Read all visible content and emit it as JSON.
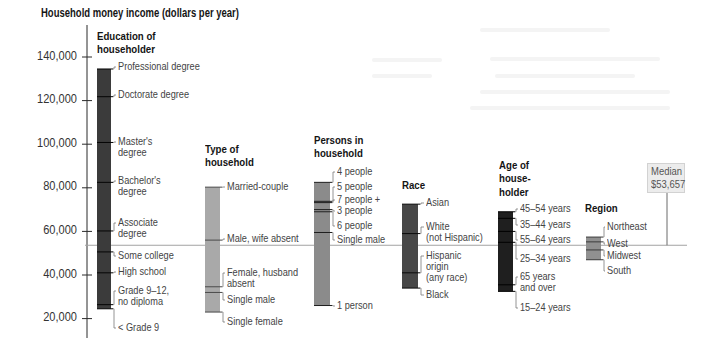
{
  "chart_data": {
    "type": "bar",
    "subtype": "floating-range-strips",
    "title": "Household money income (dollars per year)",
    "xlabel": "",
    "ylabel": "Household money income (dollars per year)",
    "ylim": [
      10000,
      150000
    ],
    "grid": false,
    "legend": "none (categories labeled directly beside each strip)",
    "y_ticks": [
      {
        "value": 140000,
        "label": "140,000"
      },
      {
        "value": 120000,
        "label": "120,000"
      },
      {
        "value": 100000,
        "label": "100,000"
      },
      {
        "value": 80000,
        "label": "80,000"
      },
      {
        "value": 60000,
        "label": "60,000"
      },
      {
        "value": 40000,
        "label": "40,000"
      },
      {
        "value": 20000,
        "label": "20,000"
      }
    ],
    "median": {
      "value": 53657,
      "label": "Median",
      "value_label": "$53,657"
    },
    "layout": {
      "y_ref_value": 140000,
      "y_ref_px": 57,
      "px_per_unit": 0.00218,
      "axis_x_px": 87,
      "axis_top_px": 25,
      "median_line_end_px": 687,
      "median_leader_x_px": 667
    },
    "groups": [
      {
        "name": "Education of householder",
        "heading_lines": [
          "Education of",
          "householder"
        ],
        "heading_x_px": 97,
        "heading_y_px": [
          37,
          50
        ],
        "color": "#3b3b3b",
        "tick_color": "#050505",
        "x_px": 97,
        "width_px": 14,
        "label_x_px": 118,
        "categories": [
          {
            "label": "Professional degree",
            "lines": [
              "Professional degree"
            ],
            "value": 134500,
            "label_y_px": 67
          },
          {
            "label": "Doctorate degree",
            "lines": [
              "Doctorate degree"
            ],
            "value": 121800,
            "label_y_px": 95
          },
          {
            "label": "Master's degree",
            "lines": [
              "Master's",
              "degree"
            ],
            "value": 100800,
            "label_y_px": 142
          },
          {
            "label": "Bachelor's degree",
            "lines": [
              "Bachelor's",
              "degree"
            ],
            "value": 82500,
            "label_y_px": 181
          },
          {
            "label": "Associate degree",
            "lines": [
              "Associate",
              "degree"
            ],
            "value": 60200,
            "label_y_px": 223
          },
          {
            "label": "Some college",
            "lines": [
              "Some college"
            ],
            "value": 50600,
            "label_y_px": 256
          },
          {
            "label": "High school",
            "lines": [
              "High school"
            ],
            "value": 41000,
            "label_y_px": 272
          },
          {
            "label": "Grade 9–12, no diploma",
            "lines": [
              "Grade 9–12,",
              "no diploma"
            ],
            "value": 26400,
            "label_y_px": 291
          },
          {
            "label": "< Grade 9",
            "lines": [
              "< Grade 9"
            ],
            "value": 24500,
            "label_y_px": 328
          }
        ]
      },
      {
        "name": "Type of household",
        "heading_lines": [
          "Type of",
          "household"
        ],
        "heading_x_px": 205,
        "heading_y_px": [
          150,
          163
        ],
        "color": "#a9a9a9",
        "tick_color": "#4a4a4a",
        "x_px": 205,
        "width_px": 15,
        "label_x_px": 227,
        "categories": [
          {
            "label": "Married-couple",
            "lines": [
              "Married-couple"
            ],
            "value": 80300,
            "label_y_px": 187
          },
          {
            "label": "Male, wife absent",
            "lines": [
              "Male, wife absent"
            ],
            "value": 56000,
            "label_y_px": 239
          },
          {
            "label": "Female, husband absent",
            "lines": [
              "Female, husband",
              "absent"
            ],
            "value": 34600,
            "label_y_px": 273
          },
          {
            "label": "Single male",
            "lines": [
              "Single male"
            ],
            "value": 32000,
            "label_y_px": 300
          },
          {
            "label": "Single female",
            "lines": [
              "Single female"
            ],
            "value": 23000,
            "label_y_px": 322
          }
        ]
      },
      {
        "name": "Persons in household",
        "heading_lines": [
          "Persons in",
          "household"
        ],
        "heading_x_px": 314,
        "heading_y_px": [
          141,
          154
        ],
        "color": "#8b8b8b",
        "tick_color": "#1e1e1e",
        "x_px": 314,
        "width_px": 16,
        "label_x_px": 337,
        "categories": [
          {
            "label": "4 people",
            "lines": [
              "4 people"
            ],
            "value": 82500,
            "label_y_px": 172
          },
          {
            "label": "5 people",
            "lines": [
              "5 people"
            ],
            "value": 73800,
            "label_y_px": 187
          },
          {
            "label": "7 people +",
            "lines": [
              "7 people +"
            ],
            "value": 73200,
            "label_y_px": 200
          },
          {
            "label": "3 people",
            "lines": [
              "3 people"
            ],
            "value": 70000,
            "label_y_px": 211
          },
          {
            "label": "6 people",
            "lines": [
              "6 people"
            ],
            "value": 69000,
            "label_y_px": 226
          },
          {
            "label": "Single male",
            "lines": [
              "Single male"
            ],
            "value": 59500,
            "label_y_px": 240
          },
          {
            "label": "1 person",
            "lines": [
              "1 person"
            ],
            "value": 26000,
            "label_y_px": 306
          }
        ]
      },
      {
        "name": "Race",
        "heading_lines": [
          "Race"
        ],
        "heading_x_px": 402,
        "heading_y_px": [
          186
        ],
        "color": "#474747",
        "tick_color": "#0a0a0a",
        "x_px": 402,
        "width_px": 16,
        "label_x_px": 426,
        "categories": [
          {
            "label": "Asian",
            "lines": [
              "Asian"
            ],
            "value": 72500,
            "label_y_px": 203
          },
          {
            "label": "White (not Hispanic)",
            "lines": [
              "White",
              "(not Hispanic)"
            ],
            "value": 59000,
            "label_y_px": 227
          },
          {
            "label": "Hispanic origin (any race)",
            "lines": [
              "Hispanic",
              "origin",
              "(any race)"
            ],
            "value": 41000,
            "label_y_px": 256
          },
          {
            "label": "Black",
            "lines": [
              "Black"
            ],
            "value": 34000,
            "label_y_px": 295
          }
        ]
      },
      {
        "name": "Age of householder",
        "heading_lines": [
          "Age of",
          "house-",
          "holder"
        ],
        "heading_x_px": 499,
        "heading_y_px": [
          166,
          179,
          193
        ],
        "color": "#1f1f1f",
        "tick_color": "#000000",
        "x_px": 498,
        "width_px": 15,
        "label_x_px": 520,
        "categories": [
          {
            "label": "45–54 years",
            "lines": [
              "45–54 years"
            ],
            "value": 69000,
            "label_y_px": 209
          },
          {
            "label": "35–44 years",
            "lines": [
              "35–44 years"
            ],
            "value": 66000,
            "label_y_px": 225
          },
          {
            "label": "55–64 years",
            "lines": [
              "55–64 years"
            ],
            "value": 60000,
            "label_y_px": 240
          },
          {
            "label": "25–34 years",
            "lines": [
              "25–34 years"
            ],
            "value": 55000,
            "label_y_px": 259
          },
          {
            "label": "65 years and over",
            "lines": [
              "65 years",
              "and over"
            ],
            "value": 35500,
            "label_y_px": 277
          },
          {
            "label": "15–24 years",
            "lines": [
              "15–24 years"
            ],
            "value": 32500,
            "label_y_px": 308
          }
        ]
      },
      {
        "name": "Region",
        "heading_lines": [
          "Region"
        ],
        "heading_x_px": 585,
        "heading_y_px": [
          209
        ],
        "color": "#909090",
        "tick_color": "#3a3a3a",
        "x_px": 586,
        "width_px": 15,
        "label_x_px": 607,
        "categories": [
          {
            "label": "Northeast",
            "lines": [
              "Northeast"
            ],
            "value": 57400,
            "label_y_px": 227
          },
          {
            "label": "West",
            "lines": [
              "West"
            ],
            "value": 55200,
            "label_y_px": 244
          },
          {
            "label": "Midwest",
            "lines": [
              "Midwest"
            ],
            "value": 51500,
            "label_y_px": 256
          },
          {
            "label": "South",
            "lines": [
              "South"
            ],
            "value": 47000,
            "label_y_px": 271
          }
        ]
      }
    ]
  }
}
